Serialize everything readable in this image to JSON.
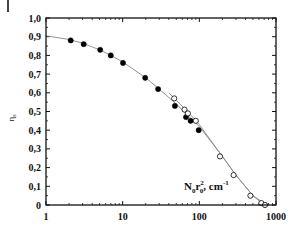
{
  "chart_data": {
    "type": "scatter",
    "title": "",
    "xlabel": "N0r0^2, cm^-1",
    "xlabel_parts": {
      "base": "N",
      "sub1": "0",
      "mid": "r",
      "sub2": "0",
      "sup2": "2",
      "unit": ", cm",
      "unit_sup": "-1"
    },
    "ylabel": "ηs",
    "ylabel_parts": {
      "base": "η",
      "sub": "s"
    },
    "xscale": "log",
    "xlim": [
      1,
      1000
    ],
    "ylim": [
      0,
      1.0
    ],
    "x_tick_labels": [
      "1",
      "10",
      "100",
      "1000"
    ],
    "x_tick_values": [
      1,
      10,
      100,
      1000
    ],
    "y_tick_labels": [
      "0",
      "0,1",
      "0,2",
      "0,3",
      "0,4",
      "0,5",
      "0,6",
      "0,7",
      "0,8",
      "0,9",
      "1,0"
    ],
    "y_tick_values": [
      0,
      0.1,
      0.2,
      0.3,
      0.4,
      0.5,
      0.6,
      0.7,
      0.8,
      0.9,
      1.0
    ],
    "grid": false,
    "legend": null,
    "series": [
      {
        "name": "filled",
        "marker": "filled-circle",
        "x": [
          2.1,
          3.1,
          5.1,
          7.0,
          10.1,
          19.7,
          29,
          48,
          67,
          77,
          98
        ],
        "y": [
          0.88,
          0.86,
          0.83,
          0.8,
          0.76,
          0.68,
          0.62,
          0.53,
          0.47,
          0.45,
          0.4
        ]
      },
      {
        "name": "open",
        "marker": "open-circle",
        "x": [
          47,
          64,
          71,
          90,
          186,
          280,
          463,
          643,
          718
        ],
        "y": [
          0.57,
          0.51,
          0.49,
          0.45,
          0.26,
          0.16,
          0.05,
          0.01,
          0.0
        ]
      },
      {
        "name": "fit-curve",
        "marker": "line",
        "x": [
          1,
          2,
          3,
          5,
          7,
          10,
          20,
          30,
          50,
          70,
          100,
          200,
          300,
          500,
          700
        ],
        "y": [
          0.905,
          0.885,
          0.865,
          0.83,
          0.8,
          0.765,
          0.68,
          0.62,
          0.54,
          0.48,
          0.42,
          0.26,
          0.16,
          0.05,
          0.0
        ]
      },
      {
        "name": "fit-curve-2",
        "marker": "line",
        "x": [
          40,
          50,
          70,
          100,
          200,
          300,
          500,
          700,
          800
        ],
        "y": [
          0.6,
          0.56,
          0.5,
          0.43,
          0.26,
          0.16,
          0.05,
          0.01,
          0.0
        ]
      }
    ]
  },
  "colors": {
    "axis": "#111111",
    "marker": "#000000",
    "line": "#888888",
    "background": "#ffffff"
  }
}
